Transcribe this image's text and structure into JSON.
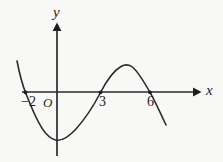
{
  "figure": {
    "kind": "coordinate-plane-cubic-curve",
    "background_color": "#f8f8f6",
    "ink_color": "#2b2b2b"
  },
  "axes": {
    "x_label": "x",
    "y_label": "y",
    "origin_label": "O",
    "x_axis_y_px": 92,
    "y_axis_x_px": 57,
    "x_axis_start_px": 22,
    "x_axis_arrow_tip_px": 201,
    "y_axis_arrow_tip_px": 23,
    "y_axis_bottom_px": 156
  },
  "tick_labels": [
    {
      "name": "neg-two",
      "text": "−2",
      "x_px": 21,
      "y_px": 94
    },
    {
      "name": "three",
      "text": "3",
      "x_px": 99,
      "y_px": 94
    },
    {
      "name": "six",
      "text": "6",
      "x_px": 147,
      "y_px": 94
    }
  ],
  "scan_artifacts": [
    {
      "name": "ghost-a",
      "text": "· · ·· ·"
    },
    {
      "name": "ghost-b",
      "text": "·· ·  ······· ·· ·"
    },
    {
      "name": "ghost-c",
      "text": "· ·· · ·"
    },
    {
      "name": "ghost-d",
      "text": "· ·· ·"
    },
    {
      "name": "ghost-e",
      "text": "·· · ··"
    },
    {
      "name": "ghost-f",
      "text": "· ·"
    }
  ],
  "chart_data": {
    "type": "line",
    "title": "",
    "xlabel": "x",
    "ylabel": "y",
    "grid": false,
    "legend": null,
    "x_intercepts": [
      -2,
      3,
      6
    ],
    "local_minimum": {
      "x": 0.2,
      "y": -1.0
    },
    "local_maximum": {
      "x": 4.7,
      "y": 0.85
    },
    "end_behavior": {
      "left": "up",
      "right": "down"
    },
    "leading_coefficient_sign": "negative",
    "curve_points_px": [
      {
        "x": 17,
        "y": 61
      },
      {
        "x": 25,
        "y": 92
      },
      {
        "x": 34,
        "y": 117
      },
      {
        "x": 44,
        "y": 133
      },
      {
        "x": 57,
        "y": 140
      },
      {
        "x": 70,
        "y": 136
      },
      {
        "x": 83,
        "y": 122
      },
      {
        "x": 92,
        "y": 108
      },
      {
        "x": 100,
        "y": 92
      },
      {
        "x": 110,
        "y": 77
      },
      {
        "x": 120,
        "y": 68
      },
      {
        "x": 128,
        "y": 65
      },
      {
        "x": 136,
        "y": 70
      },
      {
        "x": 144,
        "y": 82
      },
      {
        "x": 150,
        "y": 92
      },
      {
        "x": 158,
        "y": 108
      },
      {
        "x": 166,
        "y": 125
      }
    ],
    "curve_path_d": "M 17 61 C 20 76, 22.5 85, 25.5 92.5 C 31 106, 37 123, 45.5 133 C 50 138, 54 140.5, 58 140.3 C 64 140, 70 135.5, 76 129 C 84 120, 93 107, 100.5 92.5 C 107 80, 114 70.5, 121 66.5 C 125 64.3, 129.5 64.5, 133 67.5 C 138 71.8, 143.5 81, 150 92.3 C 155 101, 160.5 113, 166 125"
  }
}
